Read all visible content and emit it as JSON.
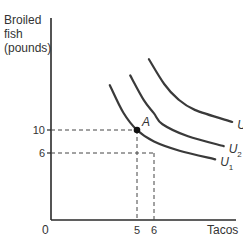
{
  "chart_data": {
    "type": "line",
    "title": "",
    "ylabel_lines": [
      "Broiled",
      "fish",
      "(pounds)"
    ],
    "xlabel": "Tacos",
    "origin_label": "0",
    "x_ticks": [
      {
        "value": 5,
        "label": "5"
      },
      {
        "value": 6,
        "label": "6"
      }
    ],
    "y_ticks": [
      {
        "value": 10,
        "label": "10"
      },
      {
        "value": 6,
        "label": "6"
      }
    ],
    "xlim": [
      0,
      14
    ],
    "ylim": [
      0,
      26
    ],
    "grid": false,
    "points": [
      {
        "name": "A",
        "x": 5,
        "y": 10,
        "label": "A"
      }
    ],
    "reference_lines": [
      {
        "from": [
          0,
          10
        ],
        "to": [
          5,
          10
        ],
        "style": "dashed"
      },
      {
        "from": [
          5,
          10
        ],
        "to": [
          5,
          0
        ],
        "style": "dashed"
      },
      {
        "from": [
          0,
          6
        ],
        "to": [
          6,
          6
        ],
        "style": "dashed"
      },
      {
        "from": [
          6,
          6
        ],
        "to": [
          6,
          0
        ],
        "style": "dashed"
      }
    ],
    "series": [
      {
        "name": "U1",
        "label_main": "U",
        "label_sub": "1",
        "points": [
          [
            3.4,
            17.8
          ],
          [
            4.2,
            13
          ],
          [
            5,
            10
          ],
          [
            6,
            8
          ],
          [
            7.5,
            6.4
          ],
          [
            9.6,
            4.9
          ]
        ]
      },
      {
        "name": "U2",
        "label_main": "U",
        "label_sub": "2",
        "points": [
          [
            4.6,
            19.5
          ],
          [
            5.4,
            15.2
          ],
          [
            6,
            12.9
          ],
          [
            6.5,
            11
          ],
          [
            8,
            8.9
          ],
          [
            10.1,
            7.2
          ]
        ]
      },
      {
        "name": "U3",
        "label_main": "U",
        "label_sub": "3",
        "points": [
          [
            5.7,
            22.3
          ],
          [
            6.6,
            18
          ],
          [
            7.4,
            15.4
          ],
          [
            8.4,
            13.5
          ],
          [
            10.6,
            11.4
          ]
        ]
      }
    ]
  }
}
